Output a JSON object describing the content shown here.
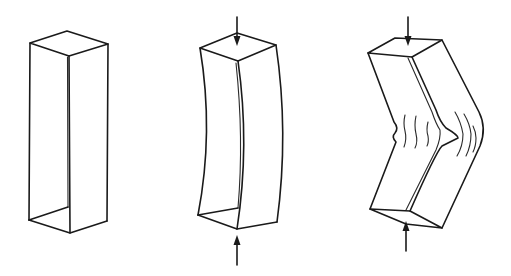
{
  "figure": {
    "stroke_color": "#1a1a1a",
    "background": "#ffffff",
    "panels": [
      {
        "id": "unloaded",
        "label": "Unloaded column",
        "has_load_arrows": false
      },
      {
        "id": "bowed",
        "label": "Column bowing under compressive load",
        "has_load_arrows": true
      },
      {
        "id": "buckled",
        "label": "Column buckled with kink and wrinkles",
        "has_load_arrows": true
      }
    ]
  }
}
